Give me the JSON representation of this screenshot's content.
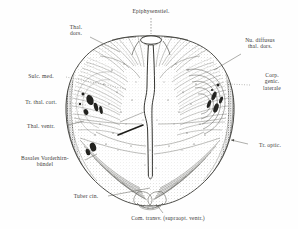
{
  "figure": {
    "kind": "anatomical-illustration",
    "background_color": "#ffffff",
    "ink_color": "#2a2a2a"
  },
  "labels": [
    {
      "id": "epiphysenstiel",
      "lines": [
        "Epiphysenstiel."
      ],
      "x": 151,
      "y": 11,
      "align": "center",
      "leader": {
        "type": "solid-vertical",
        "from": [
          151,
          18
        ],
        "to": [
          151,
          36
        ]
      }
    },
    {
      "id": "thal-dors",
      "lines": [
        "Thal.",
        "dors."
      ],
      "x": 76,
      "y": 27,
      "align": "center",
      "leader": {
        "type": "solid",
        "from": [
          90,
          38
        ],
        "to": [
          118,
          52
        ]
      }
    },
    {
      "id": "nu-diffusus-thal-dors",
      "lines": [
        "Nu. diffusus",
        "thal. dors."
      ],
      "x": 260,
      "y": 40,
      "align": "center",
      "leader": {
        "type": "solid",
        "from": [
          240,
          55
        ],
        "to": [
          213,
          70
        ]
      }
    },
    {
      "id": "sulc-med",
      "lines": [
        "Sulc. med."
      ],
      "x": 41,
      "y": 76,
      "align": "center",
      "leader": {
        "type": "dotted",
        "from": [
          66,
          79
        ],
        "to": [
          127,
          90
        ]
      }
    },
    {
      "id": "corp-genic-laterale",
      "lines": [
        "Corp.",
        "genic.",
        "laterale"
      ],
      "x": 271,
      "y": 79,
      "align": "center",
      "leader": {
        "type": "dotted",
        "from": [
          248,
          86
        ],
        "to": [
          226,
          85
        ]
      }
    },
    {
      "id": "tr-thal-cort",
      "lines": [
        "Tr. thal. cort."
      ],
      "x": 41,
      "y": 102,
      "align": "center",
      "leader": {
        "type": "dotted",
        "from": [
          69,
          104
        ],
        "to": [
          86,
          106
        ]
      }
    },
    {
      "id": "thal-ventr",
      "lines": [
        "Thal. ventr."
      ],
      "x": 41,
      "y": 126,
      "align": "center",
      "leader": {
        "type": "solid",
        "from": [
          67,
          126
        ],
        "to": [
          84,
          122
        ]
      }
    },
    {
      "id": "tr-optic",
      "lines": [
        "Tr. optic."
      ],
      "x": 268,
      "y": 145,
      "align": "center",
      "leader": {
        "type": "solid-arrow",
        "from": [
          247,
          145
        ],
        "to": [
          230,
          140
        ]
      }
    },
    {
      "id": "basales-vorderhirnbuendel",
      "lines": [
        "Basales Vorderhirn-",
        "bündel"
      ],
      "x": 45,
      "y": 158,
      "align": "center",
      "leader": {
        "type": "solid",
        "from": [
          84,
          161
        ],
        "to": [
          96,
          155
        ]
      }
    },
    {
      "id": "tuber-cin",
      "lines": [
        "Tuber cin."
      ],
      "x": 86,
      "y": 197,
      "align": "center",
      "leader": {
        "type": "solid",
        "from": [
          108,
          197
        ],
        "to": [
          150,
          188
        ]
      }
    },
    {
      "id": "com-transv-supraopt-ventr",
      "lines": [
        "Com. transv. (supraopt. ventr.)"
      ],
      "x": 168,
      "y": 219,
      "align": "center",
      "leader": {
        "type": "solid",
        "from": [
          163,
          214
        ],
        "to": [
          156,
          205
        ]
      }
    }
  ]
}
